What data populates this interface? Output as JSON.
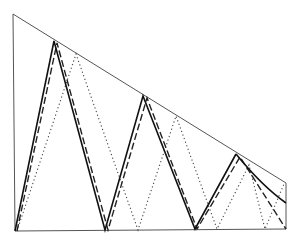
{
  "diagram": {
    "colors": {
      "frame": "#555555",
      "solid": "#111111",
      "dashed": "#222222",
      "dotted": "#444444",
      "background": "#ffffff"
    },
    "frame": {
      "points": [
        [
          13,
          14
        ],
        [
          15,
          231
        ],
        [
          286,
          229
        ],
        [
          286,
          183
        ],
        [
          13,
          14
        ]
      ]
    },
    "paths": [
      {
        "name": "solid-path",
        "style": "solid",
        "points": [
          [
            15,
            231
          ],
          [
            54,
            41
          ],
          [
            105,
            230
          ],
          [
            143,
            96
          ],
          [
            195,
            229
          ],
          [
            236,
            154
          ]
        ],
        "curve_end": {
          "from": [
            236,
            154
          ],
          "control": [
            262,
            186
          ],
          "to": [
            286,
            203
          ]
        }
      },
      {
        "name": "dashed-path",
        "style": "dashed",
        "points": [
          [
            17,
            231
          ],
          [
            57,
            43
          ],
          [
            108,
            230
          ],
          [
            147,
            98
          ],
          [
            197,
            229
          ],
          [
            240,
            157
          ],
          [
            286,
            229
          ]
        ]
      },
      {
        "name": "dotted-path",
        "style": "dotted",
        "points": [
          [
            17,
            231
          ],
          [
            76,
            54
          ],
          [
            138,
            230
          ],
          [
            176,
            116
          ],
          [
            217,
            229
          ],
          [
            249,
            165
          ],
          [
            265,
            229
          ],
          [
            284,
            184
          ]
        ]
      }
    ]
  }
}
